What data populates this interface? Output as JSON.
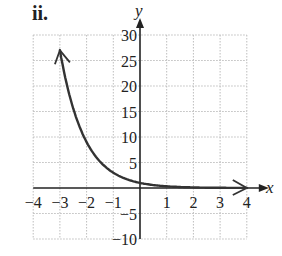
{
  "panel_label": "ii.",
  "chart_data": {
    "type": "line",
    "title": "",
    "xlabel": "x",
    "ylabel": "y",
    "xlim": [
      -4,
      4
    ],
    "ylim": [
      -10,
      30
    ],
    "grid": true,
    "grid_style": "dotted",
    "x_ticks": [
      -4,
      -3,
      -2,
      -1,
      1,
      2,
      3,
      4
    ],
    "x_tick_labels": [
      "−4",
      "−3",
      "−2",
      "−1",
      "1",
      "2",
      "3",
      "4"
    ],
    "y_ticks": [
      30,
      25,
      20,
      15,
      10,
      5,
      -5,
      -10
    ],
    "y_tick_labels": [
      "30",
      "25",
      "20",
      "15",
      "10",
      "5",
      "−5",
      "−10"
    ],
    "series": [
      {
        "name": "y = (1/3)^x",
        "x": [
          -3,
          -2.5,
          -2,
          -1.5,
          -1,
          -0.5,
          0,
          0.5,
          1,
          1.5,
          2,
          2.5,
          3,
          3.5,
          4
        ],
        "values": [
          27,
          15.59,
          9,
          5.2,
          3,
          1.73,
          1,
          0.58,
          0.33,
          0.19,
          0.11,
          0.06,
          0.04,
          0.02,
          0.01
        ],
        "arrow_left": true,
        "arrow_right": true,
        "color": "#333333"
      }
    ],
    "legend": null
  }
}
